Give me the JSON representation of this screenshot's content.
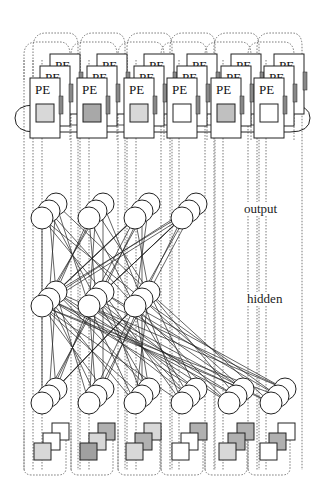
{
  "figure": {
    "pe_label": "PE",
    "layers": {
      "output_label": "output",
      "hidden_label": "hidden"
    },
    "pe_row": {
      "count": 6,
      "stack_depth": 3,
      "x_positions": [
        30,
        77,
        124,
        167,
        211,
        254
      ],
      "y_front": 78,
      "width": 30,
      "height": 60,
      "inner_square_fill": [
        "#d8d8d8",
        "#a8a8a8",
        "#d8d8d8",
        "#ffffff",
        "#c0c0c0",
        "#ffffff"
      ]
    },
    "output_neurons": {
      "count": 4,
      "x_front": [
        42,
        89,
        135,
        182
      ],
      "y_front": 218,
      "radius": 11,
      "stack_depth": 3
    },
    "hidden_neurons": {
      "count": 3,
      "x_front": [
        42,
        89,
        135
      ],
      "y_front": 306,
      "radius": 11,
      "stack_depth": 3
    },
    "input_neurons": {
      "count": 6,
      "x_front": [
        42,
        89,
        135,
        182,
        229,
        271
      ],
      "y_front": 403,
      "radius": 11,
      "stack_depth": 3
    },
    "bottom_squares": {
      "count": 6,
      "x_front": [
        34,
        80,
        126,
        172,
        219,
        260
      ],
      "y_front": 443,
      "size": 17,
      "fills": [
        [
          "#d8d8d8",
          "#ffffff",
          "#ffffff"
        ],
        [
          "#a0a0a0",
          "#d8d8d8",
          "#b0b0b0"
        ],
        [
          "#d8d8d8",
          "#b0b0b0",
          "#d8d8d8"
        ],
        [
          "#ffffff",
          "#ffffff",
          "#b0b0b0"
        ],
        [
          "#d8d8d8",
          "#b0b0b0",
          "#b0b0b0"
        ],
        [
          "#ffffff",
          "#b0b0b0",
          "#ffffff"
        ]
      ]
    },
    "colors": {
      "stroke": "#222222",
      "dotted": "#555555",
      "background": "#ffffff"
    }
  }
}
